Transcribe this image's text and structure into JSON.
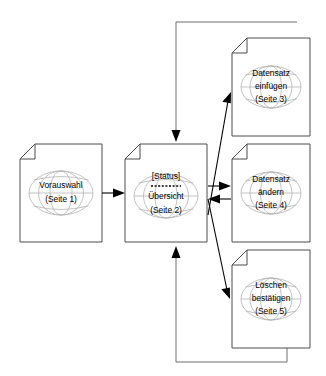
{
  "diagram": {
    "type": "page-flow-diagram",
    "background_color": "#ffffff",
    "node_border_color": "#4d4d4d",
    "globe_color": "#b3b3b3",
    "arrow_color": "#000000",
    "return_line_color": "#6e6e6e"
  },
  "nodes": [
    {
      "id": "seite1",
      "name": "vorauswahl",
      "icon": "page-with-globe-icon",
      "lines": [
        "Vorauswahl",
        "(Seite 1)"
      ],
      "status_label": "",
      "x": 20,
      "y": 144,
      "width": 82,
      "height": 98
    },
    {
      "id": "seite2",
      "name": "uebersicht",
      "icon": "page-with-globe-icon",
      "lines": [
        "Übersicht",
        "(Seite 2)"
      ],
      "status_label": "[Status]",
      "x": 125,
      "y": 144,
      "width": 82,
      "height": 98
    },
    {
      "id": "seite3",
      "name": "datensatz-einfuegen",
      "icon": "page-with-globe-icon",
      "lines": [
        "Datensatz",
        "einfügen",
        "(Seite 3)"
      ],
      "status_label": "",
      "x": 232,
      "y": 38,
      "width": 78,
      "height": 98
    },
    {
      "id": "seite4",
      "name": "datensatz-aendern",
      "icon": "page-with-globe-icon",
      "lines": [
        "Datensatz",
        "ändern",
        "(Seite 4)"
      ],
      "status_label": "",
      "x": 232,
      "y": 144,
      "width": 78,
      "height": 98
    },
    {
      "id": "seite5",
      "name": "loeschen-bestaetigen",
      "icon": "page-with-globe-icon",
      "lines": [
        "Löschen",
        "bestätigen",
        "(Seite 5)"
      ],
      "status_label": "",
      "x": 232,
      "y": 250,
      "width": 78,
      "height": 98
    }
  ],
  "connections": [
    {
      "id": "c1",
      "name": "seite1-to-seite2",
      "from": "seite1",
      "to": "seite2",
      "style": "straight-arrow"
    },
    {
      "id": "c2",
      "name": "seite2-to-seite3",
      "from": "seite2",
      "to": "seite3",
      "style": "diagonal-arrow"
    },
    {
      "id": "c3",
      "name": "seite2-to-seite4",
      "from": "seite2",
      "to": "seite4",
      "style": "straight-arrow"
    },
    {
      "id": "c4",
      "name": "seite4-to-seite2",
      "from": "seite4",
      "to": "seite2",
      "style": "straight-arrow-back"
    },
    {
      "id": "c5",
      "name": "seite2-to-seite5",
      "from": "seite2",
      "to": "seite5",
      "style": "diagonal-arrow"
    },
    {
      "id": "c6",
      "name": "seite3-to-seite2-return",
      "from": "seite3",
      "to": "seite2",
      "style": "top-return-path"
    },
    {
      "id": "c7",
      "name": "seite5-to-seite2-return",
      "from": "seite5",
      "to": "seite2",
      "style": "bottom-return-path"
    }
  ]
}
